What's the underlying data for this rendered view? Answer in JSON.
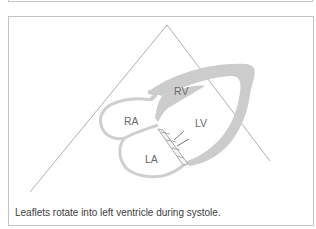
{
  "figure": {
    "labels": {
      "rv": "RV",
      "ra": "RA",
      "lv": "LV",
      "la": "LA"
    },
    "caption": "Leaflets rotate into left ventricle during systole."
  },
  "colors": {
    "border": "#c4c4c4",
    "myocardium": "#cccccc",
    "line": "#8a8a8a",
    "text": "#404040"
  }
}
